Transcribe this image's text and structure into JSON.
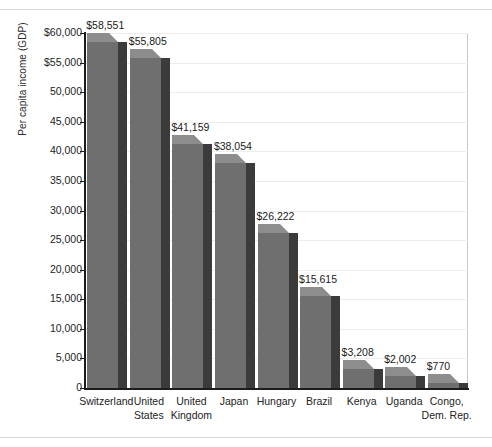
{
  "chart_data": {
    "type": "bar",
    "title": "",
    "subtitle": "",
    "xlabel": "",
    "ylabel": "Per capita income (GDP)",
    "ylim": [
      0,
      60000
    ],
    "grid": true,
    "legend": false,
    "style": "3d-bar-grayscale",
    "categories": [
      "Switzerland",
      "United States",
      "United Kingdom",
      "Japan",
      "Hungary",
      "Brazil",
      "Kenya",
      "Uganda",
      "Congo, Dem. Rep."
    ],
    "category_lines": [
      [
        "Switzerland"
      ],
      [
        "United",
        "States"
      ],
      [
        "United",
        "Kingdom"
      ],
      [
        "Japan"
      ],
      [
        "Hungary"
      ],
      [
        "Brazil"
      ],
      [
        "Kenya"
      ],
      [
        "Uganda"
      ],
      [
        "Congo,",
        "Dem. Rep."
      ]
    ],
    "values": [
      58551,
      55805,
      41159,
      38054,
      26222,
      15615,
      3208,
      2002,
      770
    ],
    "value_labels": [
      "$58,551",
      "$55,805",
      "$41,159",
      "$38,054",
      "$26,222",
      "$15,615",
      "$3,208",
      "$2,002",
      "$770"
    ],
    "yticks": [
      0,
      5000,
      10000,
      15000,
      20000,
      25000,
      30000,
      35000,
      40000,
      45000,
      50000,
      55000,
      60000
    ],
    "ytick_labels": [
      "0",
      "5,000",
      "10,000",
      "15,000",
      "20,000",
      "25,000",
      "30,000",
      "35,000",
      "40,000",
      "45,000",
      "50,000",
      "$55,000",
      "$60,000"
    ],
    "colors": {
      "bar_front": "#6f6f6f",
      "bar_top": "#8d8d8d",
      "bar_side": "#3b3b3b",
      "gridline": "#ededed",
      "axis": "#1c1c1c",
      "plot_border": "#c8c8c8",
      "text": "#232323",
      "background": "#ffffff"
    }
  }
}
